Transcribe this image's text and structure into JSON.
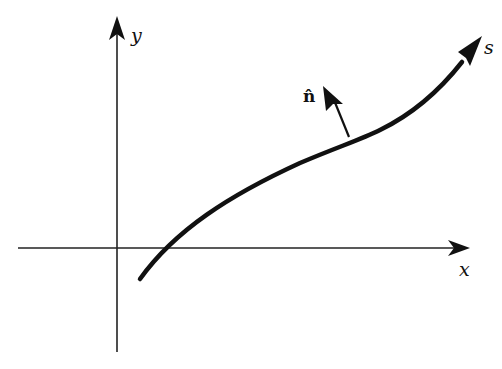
{
  "figure": {
    "type": "diagram",
    "axes": {
      "x_label": "x",
      "y_label": "y"
    },
    "curve": {
      "label": "s"
    },
    "normal_vector": {
      "label": "n̂"
    }
  }
}
